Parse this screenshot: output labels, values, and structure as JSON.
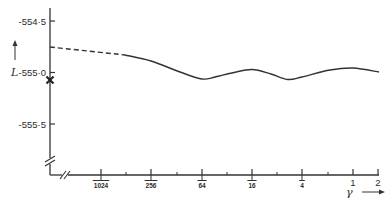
{
  "chart_data": {
    "type": "line",
    "title": "",
    "xlabel": "γ",
    "ylabel": "L",
    "x_scale": "log",
    "x_ticks": [
      {
        "value": 0.0009765625,
        "label_num": "1",
        "label_den": "1024",
        "px": 101
      },
      {
        "value": 0.00390625,
        "label_num": "1",
        "label_den": "256",
        "px": 151
      },
      {
        "value": 0.015625,
        "label_num": "1",
        "label_den": "64",
        "px": 202
      },
      {
        "value": 0.0625,
        "label_num": "1",
        "label_den": "16",
        "px": 252
      },
      {
        "value": 0.25,
        "label_num": "1",
        "label_den": "4",
        "px": 302
      },
      {
        "value": 1,
        "label": "1",
        "px": 353
      },
      {
        "value": 2,
        "label": "2",
        "px": 378
      }
    ],
    "x_minor_ticks_px": [
      126,
      177,
      227,
      277,
      328
    ],
    "y_ticks": [
      {
        "value": -554.5,
        "label": "-554·5",
        "py": 21
      },
      {
        "value": -555.0,
        "label": "-555·0",
        "py": 72.5
      },
      {
        "value": -555.5,
        "label": "-555·5",
        "py": 124
      }
    ],
    "ylim": [
      -555.7,
      -554.4
    ],
    "axis_breaks": {
      "x": true,
      "y": true
    },
    "grid": false,
    "legend": null,
    "series": [
      {
        "name": "extrapolated",
        "style": "dashed",
        "points": [
          {
            "gamma": 3e-05,
            "L": -554.75,
            "px": 50,
            "py": 47
          },
          {
            "gamma": 0.0018,
            "L": -554.83,
            "px": 125,
            "py": 55
          }
        ]
      },
      {
        "name": "computed",
        "style": "solid",
        "points": [
          {
            "gamma": 0.0018,
            "L": -554.83,
            "px": 125,
            "py": 55
          },
          {
            "gamma": 0.0039,
            "L": -554.89,
            "px": 151,
            "py": 61
          },
          {
            "gamma": 0.0089,
            "L": -555.0,
            "px": 180,
            "py": 72
          },
          {
            "gamma": 0.0156,
            "L": -555.06,
            "px": 202,
            "py": 79
          },
          {
            "gamma": 0.0215,
            "L": -555.05,
            "px": 215,
            "py": 77
          },
          {
            "gamma": 0.035,
            "L": -555.01,
            "px": 232,
            "py": 73
          },
          {
            "gamma": 0.0625,
            "L": -554.97,
            "px": 252,
            "py": 69.5
          },
          {
            "gamma": 0.11,
            "L": -555.01,
            "px": 271,
            "py": 74
          },
          {
            "gamma": 0.16,
            "L": -555.07,
            "px": 288,
            "py": 79.5
          },
          {
            "gamma": 0.25,
            "L": -555.05,
            "px": 302,
            "py": 77
          },
          {
            "gamma": 0.55,
            "L": -554.98,
            "px": 330,
            "py": 70
          },
          {
            "gamma": 1.0,
            "L": -554.96,
            "px": 353,
            "py": 68
          },
          {
            "gamma": 2.0,
            "L": -555.0,
            "px": 379,
            "py": 72
          }
        ]
      },
      {
        "name": "reference-marker",
        "style": "x-marker",
        "points": [
          {
            "gamma": 0,
            "L": -555.07,
            "px": 50,
            "py": 80
          }
        ]
      }
    ]
  },
  "axes": {
    "y_label": "L",
    "y_arrow": "↑",
    "x_label": "γ",
    "x_arrow": "→"
  }
}
